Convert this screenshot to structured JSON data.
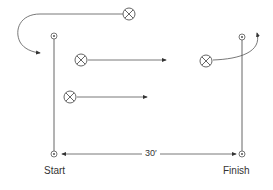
{
  "diagram": {
    "type": "drill-layout",
    "labels": {
      "start": "Start",
      "finish": "Finish",
      "distance": "30′"
    },
    "stroke_color": "#555555",
    "posts": [
      {
        "id": "start-top",
        "x": 54,
        "y": 36
      },
      {
        "id": "start-bottom",
        "x": 54,
        "y": 154
      },
      {
        "id": "finish-top",
        "x": 242,
        "y": 37
      },
      {
        "id": "finish-bottom",
        "x": 242,
        "y": 154
      }
    ],
    "players": [
      {
        "id": "player-1",
        "x": 129,
        "y": 14,
        "path": "curve-to-start"
      },
      {
        "id": "player-2",
        "x": 81,
        "y": 60,
        "path": "straight-right"
      },
      {
        "id": "player-3",
        "x": 70,
        "y": 97,
        "path": "straight-right"
      },
      {
        "id": "player-4",
        "x": 206,
        "y": 60,
        "path": "curve-up-past-finish"
      }
    ]
  }
}
